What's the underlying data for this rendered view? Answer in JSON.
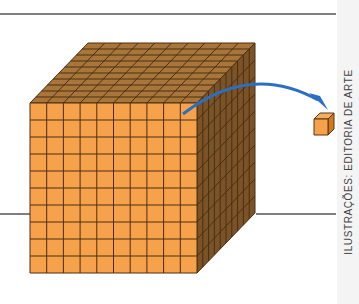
{
  "diagram": {
    "large_cube": {
      "rows": 10,
      "columns": 10,
      "depth": 10,
      "face_color": "#f5a24a",
      "top_color": "#a8763a",
      "side_color": "#7a5428",
      "line_color": "#4a2e10"
    },
    "unit_cube": {
      "face_color": "#f5a24a",
      "top_color": "#f0b060",
      "side_color": "#d07a20"
    },
    "arrow_color": "#2a6fc4",
    "rule_color": "#555555"
  },
  "credit": {
    "text": "ILUSTRAÇÕES: EDITORIA DE ARTE"
  }
}
